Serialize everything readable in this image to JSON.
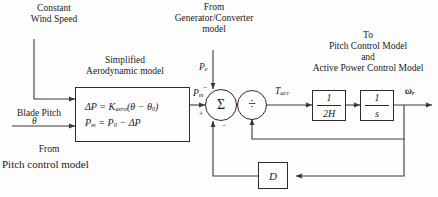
{
  "diagram": {
    "annotations": {
      "constant_wind_speed_line1": "Constant",
      "constant_wind_speed_line2": "Wind  Speed",
      "simplified_line1": "Simplified",
      "simplified_line2": "Aerodynamic model",
      "from_gen_line1": "From",
      "from_gen_line2": "Generator/Converter",
      "from_gen_line3": "model",
      "to_line1": "To",
      "to_line2": "Pitch Control Model",
      "to_line3": "and",
      "to_line4": "Active Power Control Model",
      "blade_pitch": "Blade Pitch",
      "from_pitch_line1": "From",
      "from_pitch_line2": "Pitch control model"
    },
    "blocks": {
      "aero": {
        "name": "simplified-aerodynamic-model",
        "equation_1": "ΔP = Kₐᵣₒ(θ − θ₀)",
        "equation_1_parts": {
          "lhs": "ΔP",
          "eq": "=",
          "gain": "K",
          "gain_sub": "aero",
          "expr": "(θ − θ",
          "expr_sub": "0",
          "expr_close": ")"
        },
        "equation_2_parts": {
          "lhs": "P",
          "lhs_sub": "m",
          "eq": "=",
          "rhs": "P",
          "rhs_sub": "0",
          "tail": "− ΔP"
        }
      },
      "inertia": {
        "name": "inertia-block",
        "numerator": "1",
        "denominator": "2H"
      },
      "integrator": {
        "name": "integrator-block",
        "numerator": "1",
        "denominator": "s"
      },
      "damping": {
        "name": "damping-block",
        "label": "D"
      }
    },
    "junctions": {
      "summing": {
        "name": "summing-junction",
        "glyph": "Σ",
        "sign_top": "−",
        "sign_bottom": "−",
        "sign_left": "+"
      },
      "divider": {
        "name": "divider-junction",
        "glyph": "÷"
      }
    },
    "signals": {
      "pitch_theta": "θ",
      "p_e": "P",
      "p_e_sub": "e",
      "p_m": "P",
      "p_m_sub": "m",
      "t_acc": "T",
      "t_acc_sub": "acc",
      "omega_r": "ω",
      "omega_r_sub": "r"
    },
    "colors": {
      "line": "#3a3a3a",
      "box_border": "#2b2b2b",
      "text": "#1a1a1a",
      "background": "#fdfdfd"
    }
  }
}
